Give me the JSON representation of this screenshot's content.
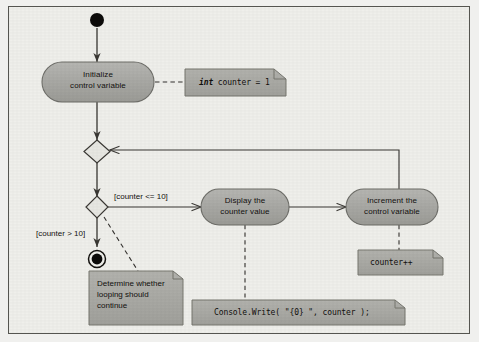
{
  "diagram": {
    "colors": {
      "canvas_background": "#efefeb",
      "page_background": "#f0f0ee",
      "frame_border": "#555550",
      "activity_fill": "#a8a8a4",
      "activity_border": "#6f6f6b",
      "note_fill": "#a9a9a5",
      "note_border": "#76766f",
      "line": "#3a3834",
      "text": "#13110f"
    },
    "nodes": {
      "initial": {
        "name": "initial-node",
        "type": "initial"
      },
      "initialize": {
        "label": "Initialize\ncontrol variable",
        "type": "activity"
      },
      "merge": {
        "name": "merge-node",
        "type": "merge"
      },
      "decision": {
        "name": "decision-node",
        "type": "decision"
      },
      "display": {
        "label": "Display the\ncounter value",
        "type": "activity"
      },
      "increment": {
        "label": "Increment the\ncontrol variable",
        "type": "activity"
      },
      "final": {
        "name": "final-node",
        "type": "final"
      }
    },
    "guards": {
      "loop_continue": "[counter <= 10]",
      "loop_exit": "[counter > 10]"
    },
    "notes": {
      "init_note": {
        "keyword": "int",
        "rest": " counter =  1"
      },
      "decision_note": "Determine whether\nlooping should\ncontinue",
      "display_note": "Console.Write( \"{0}  \", counter );",
      "increment_note": "counter++"
    }
  }
}
